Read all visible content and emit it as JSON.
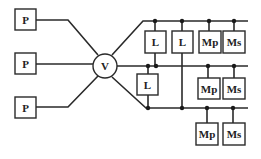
{
  "diagram": {
    "title": "",
    "hub": {
      "label": "V"
    },
    "sources": [
      {
        "label": "P"
      },
      {
        "label": "P"
      },
      {
        "label": "P"
      }
    ],
    "buses": {
      "top": {
        "loads": [
          {
            "label": "L"
          },
          {
            "label": "L"
          },
          {
            "label": "Mp"
          },
          {
            "label": "Ms"
          }
        ]
      },
      "middle": {
        "loads": [
          {
            "label": "L"
          },
          {
            "label": "Mp"
          },
          {
            "label": "Ms"
          }
        ]
      },
      "bottom": {
        "loads": [
          {
            "label": "Mp"
          },
          {
            "label": "Ms"
          }
        ]
      }
    },
    "colors": {
      "line": "#2a2a2a",
      "background": "#ffffff"
    }
  }
}
